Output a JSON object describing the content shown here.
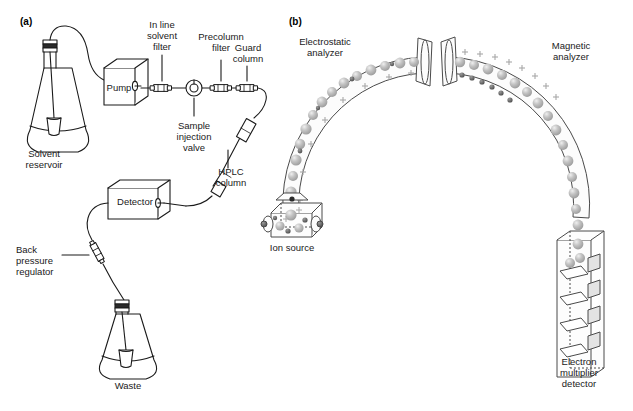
{
  "figure": {
    "background": "#ffffff",
    "line_color": "#1a1a1a",
    "sphere_color": "#b4b4b4",
    "charge_color": "#9a9a9a"
  },
  "panels": [
    {
      "id": "a",
      "label": "(a)",
      "caption": "HPLC instrument flow path"
    },
    {
      "id": "b",
      "label": "(b)",
      "caption": "Double focusing mass spectrometer"
    }
  ],
  "panel_a": {
    "components": [
      {
        "name": "solvent-reservoir",
        "label": "Solvent\nreservoir",
        "x": 18,
        "y": 148
      },
      {
        "name": "pump",
        "label": "Pump",
        "x": 93,
        "y": 84
      },
      {
        "name": "in-line-solvent-filter",
        "label": "In line\nsolvent\nfilter",
        "x": 131,
        "y": 24
      },
      {
        "name": "sample-injection-valve",
        "label": "Sample\ninjection\nvalve",
        "x": 154,
        "y": 122
      },
      {
        "name": "precolumn-filter",
        "label": "Precolumn\nfilter",
        "x": 186,
        "y": 35
      },
      {
        "name": "guard-column",
        "label": "Guard\ncolumn",
        "x": 228,
        "y": 46
      },
      {
        "name": "hplc-column",
        "label": "HPLC\ncolumn",
        "x": 213,
        "y": 168
      },
      {
        "name": "detector",
        "label": "Detector",
        "x": 111,
        "y": 193
      },
      {
        "name": "back-pressure-regulator",
        "label": "Back\npressure\nregulator",
        "x": 33,
        "y": 248
      },
      {
        "name": "waste-flask",
        "label": "Waste",
        "x": 122,
        "y": 381
      }
    ]
  },
  "panel_b": {
    "components": [
      {
        "name": "electrostatic-analyzer",
        "label": "Electrostatic\nanalyzer",
        "x": 296,
        "y": 38
      },
      {
        "name": "magnetic-analyzer",
        "label": "Magnetic\nanalyzer",
        "x": 543,
        "y": 42
      },
      {
        "name": "ion-source",
        "label": "Ion source",
        "x": 259,
        "y": 243
      },
      {
        "name": "electron-multiplier-detector",
        "label": "Electron\nmultiplier\ndetector",
        "x": 558,
        "y": 358
      }
    ]
  }
}
